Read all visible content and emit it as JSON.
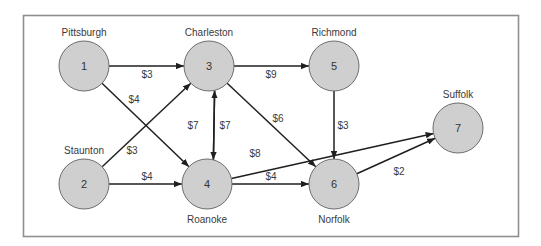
{
  "diagram": {
    "type": "directed-network",
    "nodes": [
      {
        "id": "1",
        "label": "1",
        "city": "Pittsburgh",
        "cx": 84,
        "cy": 66,
        "r": 25,
        "city_x": 84,
        "city_y": 36
      },
      {
        "id": "2",
        "label": "2",
        "city": "Staunton",
        "cx": 84,
        "cy": 184,
        "r": 25,
        "city_x": 84,
        "city_y": 154
      },
      {
        "id": "3",
        "label": "3",
        "city": "Charleston",
        "cx": 209,
        "cy": 66,
        "r": 25,
        "city_x": 209,
        "city_y": 36
      },
      {
        "id": "4",
        "label": "4",
        "city": "Roanoke",
        "cx": 207,
        "cy": 184,
        "r": 25,
        "city_x": 207,
        "city_y": 223
      },
      {
        "id": "5",
        "label": "5",
        "city": "Richmond",
        "cx": 334,
        "cy": 66,
        "r": 25,
        "city_x": 334,
        "city_y": 36
      },
      {
        "id": "6",
        "label": "6",
        "city": "Norfolk",
        "cx": 334,
        "cy": 184,
        "r": 25,
        "city_x": 334,
        "city_y": 223
      },
      {
        "id": "7",
        "label": "7",
        "city": "Suffolk",
        "cx": 458,
        "cy": 128,
        "r": 25,
        "city_x": 458,
        "city_y": 98
      }
    ],
    "edges": [
      {
        "from": "1",
        "to": "3",
        "cost": "$3",
        "label_x": 147,
        "label_y": 78
      },
      {
        "from": "1",
        "to": "4",
        "cost": "$4",
        "label_x": 134,
        "label_y": 103
      },
      {
        "from": "2",
        "to": "3",
        "cost": "$3",
        "label_x": 132,
        "label_y": 154
      },
      {
        "from": "2",
        "to": "4",
        "cost": "$4",
        "label_x": 147,
        "label_y": 180
      },
      {
        "from": "3",
        "to": "5",
        "cost": "$9",
        "label_x": 271,
        "label_y": 78
      },
      {
        "from": "3",
        "to": "4",
        "cost": "$7",
        "label_x": 193,
        "label_y": 129
      },
      {
        "from": "4",
        "to": "3",
        "cost": "$7",
        "label_x": 225,
        "label_y": 129
      },
      {
        "from": "3",
        "to": "6",
        "cost": "$6",
        "label_x": 278,
        "label_y": 122
      },
      {
        "from": "4",
        "to": "7",
        "cost": "$8",
        "label_x": 255,
        "label_y": 157
      },
      {
        "from": "4",
        "to": "6",
        "cost": "$4",
        "label_x": 271,
        "label_y": 180
      },
      {
        "from": "5",
        "to": "6",
        "cost": "$3",
        "label_x": 343,
        "label_y": 129
      },
      {
        "from": "6",
        "to": "7",
        "cost": "$2",
        "label_x": 399,
        "label_y": 175
      }
    ]
  },
  "colors": {
    "node_fill": "#cfcfcf",
    "node_stroke": "#6d6d6d",
    "edge": "#1f1f1f",
    "frame": "#8f8f8f",
    "text": "#3a3a3a"
  }
}
